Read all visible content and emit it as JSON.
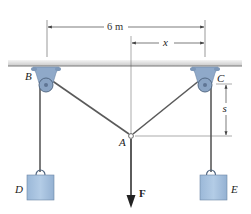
{
  "figure": {
    "labels": {
      "pulley_left": "B",
      "pulley_right": "C",
      "junction": "A",
      "block_left": "D",
      "block_right": "E",
      "force": "F"
    },
    "dimensions": {
      "span": "6 m",
      "horizontal_offset": "x",
      "vertical_sag": "s"
    },
    "colors": {
      "ceiling": "#8c8c8c",
      "pulley_bracket": "#8fa9c9",
      "block_fill": "#a9c3e0",
      "cable": "#555555",
      "dimension_line": "#444444"
    }
  }
}
